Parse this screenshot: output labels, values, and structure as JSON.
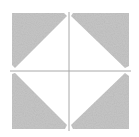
{
  "diagram": {
    "colors": {
      "background": "#ffffff",
      "fill": "#c6c6c6",
      "line": "#a8a8a8"
    },
    "square": {
      "x": 12,
      "y": 13,
      "size": 117
    },
    "crosshair": {
      "x": 69,
      "y": 71
    }
  }
}
